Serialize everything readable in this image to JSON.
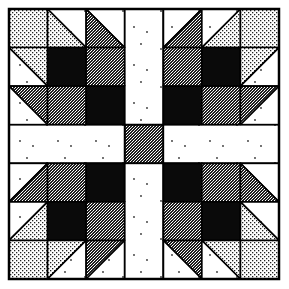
{
  "figure": {
    "title": "",
    "type": "quilt-block-illustration",
    "pattern_name": "",
    "grid": {
      "rows": 7,
      "cols": 7
    },
    "frame": {
      "x": 9,
      "y": 9,
      "size": 270
    },
    "colors": {
      "background": "#ffffff",
      "outline": "#000000",
      "dark": "#0a0a0a",
      "medium_fill": "#5a5a5a",
      "light_fill": "#cfcfcf",
      "white_fill": "#ffffff"
    },
    "fabrics": [
      "white",
      "light-dot",
      "medium-speckle",
      "black"
    ],
    "legend": {
      "W": "white with sparse dots",
      "L": "light dot print",
      "M": "medium speckle print",
      "K": "solid black"
    },
    "cells": [
      [
        {
          "t": "sq",
          "f": "L"
        },
        {
          "t": "hst",
          "d": "tl-br",
          "a": "W",
          "b": "L"
        },
        {
          "t": "hst",
          "d": "tl-br",
          "a": "W",
          "b": "M"
        },
        {
          "t": "sash",
          "f": "W"
        },
        {
          "t": "hst",
          "d": "tr-bl",
          "a": "W",
          "b": "M"
        },
        {
          "t": "hst",
          "d": "tr-bl",
          "a": "W",
          "b": "L"
        },
        {
          "t": "sq",
          "f": "L"
        }
      ],
      [
        {
          "t": "hst",
          "d": "tl-br",
          "a": "L",
          "b": "W"
        },
        {
          "t": "sq",
          "f": "K"
        },
        {
          "t": "sq",
          "f": "M"
        },
        {
          "t": "sash",
          "f": "W"
        },
        {
          "t": "sq",
          "f": "M"
        },
        {
          "t": "sq",
          "f": "K"
        },
        {
          "t": "hst",
          "d": "tr-bl",
          "a": "L",
          "b": "W"
        }
      ],
      [
        {
          "t": "hst",
          "d": "tl-br",
          "a": "M",
          "b": "W"
        },
        {
          "t": "sq",
          "f": "M"
        },
        {
          "t": "sq",
          "f": "K"
        },
        {
          "t": "sash",
          "f": "W"
        },
        {
          "t": "sq",
          "f": "K"
        },
        {
          "t": "sq",
          "f": "M"
        },
        {
          "t": "hst",
          "d": "tr-bl",
          "a": "M",
          "b": "W"
        }
      ],
      [
        {
          "t": "sash",
          "f": "W"
        },
        {
          "t": "sash",
          "f": "W"
        },
        {
          "t": "sash",
          "f": "W"
        },
        {
          "t": "sq",
          "f": "M"
        },
        {
          "t": "sash",
          "f": "W"
        },
        {
          "t": "sash",
          "f": "W"
        },
        {
          "t": "sash",
          "f": "W"
        }
      ],
      [
        {
          "t": "hst",
          "d": "tr-bl",
          "a": "W",
          "b": "M"
        },
        {
          "t": "sq",
          "f": "M"
        },
        {
          "t": "sq",
          "f": "K"
        },
        {
          "t": "sash",
          "f": "W"
        },
        {
          "t": "sq",
          "f": "K"
        },
        {
          "t": "sq",
          "f": "M"
        },
        {
          "t": "hst",
          "d": "tl-br",
          "a": "W",
          "b": "M"
        }
      ],
      [
        {
          "t": "hst",
          "d": "tr-bl",
          "a": "W",
          "b": "L"
        },
        {
          "t": "sq",
          "f": "K"
        },
        {
          "t": "sq",
          "f": "M"
        },
        {
          "t": "sash",
          "f": "W"
        },
        {
          "t": "sq",
          "f": "M"
        },
        {
          "t": "sq",
          "f": "K"
        },
        {
          "t": "hst",
          "d": "tl-br",
          "a": "W",
          "b": "L"
        }
      ],
      [
        {
          "t": "sq",
          "f": "L"
        },
        {
          "t": "hst",
          "d": "tr-bl",
          "a": "L",
          "b": "W"
        },
        {
          "t": "hst",
          "d": "tr-bl",
          "a": "M",
          "b": "W"
        },
        {
          "t": "sash",
          "f": "W"
        },
        {
          "t": "hst",
          "d": "tl-br",
          "a": "M",
          "b": "W"
        },
        {
          "t": "hst",
          "d": "tl-br",
          "a": "L",
          "b": "W"
        },
        {
          "t": "sq",
          "f": "L"
        }
      ]
    ]
  }
}
